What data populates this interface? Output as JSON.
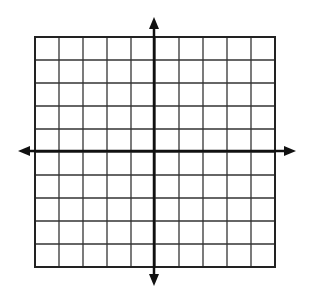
{
  "diagram": {
    "type": "coordinate-plane",
    "grid": {
      "columns": 10,
      "rows": 10,
      "left": 35,
      "top": 37,
      "right": 275,
      "bottom": 267,
      "line_color": "#333333",
      "border_color": "#222222"
    },
    "axes": {
      "x_axis_y": 151,
      "y_axis_x": 154,
      "x_min": 18,
      "x_max": 296,
      "y_min": 17,
      "y_max": 286,
      "color": "#111111"
    }
  }
}
